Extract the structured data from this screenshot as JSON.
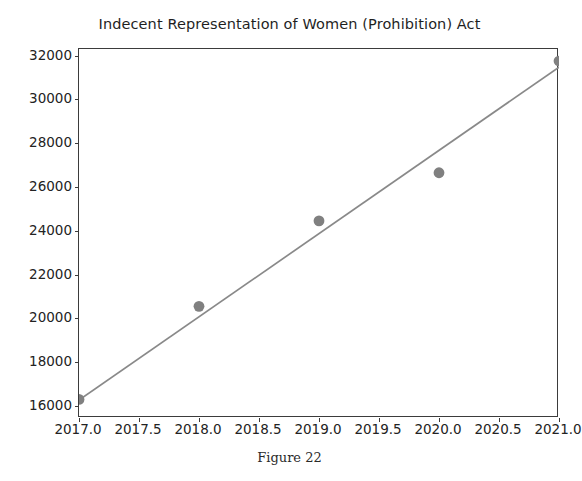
{
  "figure": {
    "caption": "Figure 22",
    "background_color": "#ffffff"
  },
  "chart_data": {
    "type": "scatter",
    "title": "Indecent Representation of Women (Prohibition) Act",
    "xlabel": "",
    "ylabel": "",
    "xlim": [
      2017.0,
      2021.0
    ],
    "ylim": [
      15450,
      32300
    ],
    "grid": false,
    "legend": null,
    "marker_color": "#808080",
    "line_color": "#898989",
    "axis_color": "#3b3b3b",
    "x": [
      2017,
      2018,
      2019,
      2020,
      2021
    ],
    "values": [
      16300,
      20550,
      24450,
      26650,
      31750
    ],
    "series": [
      {
        "name": "Cases",
        "type": "scatter",
        "x": [
          2017,
          2018,
          2019,
          2020,
          2021
        ],
        "values": [
          16300,
          20550,
          24450,
          26650,
          31750
        ]
      },
      {
        "name": "Trend line",
        "type": "line",
        "x": [
          2017,
          2021
        ],
        "values": [
          16270,
          31470
        ]
      }
    ],
    "xticks": [
      2017.0,
      2017.5,
      2018.0,
      2018.5,
      2019.0,
      2019.5,
      2020.0,
      2020.5,
      2021.0
    ],
    "xticklabels": [
      "2017.0",
      "2017.5",
      "2018.0",
      "2018.5",
      "2019.0",
      "2019.5",
      "2020.0",
      "2020.5",
      "2021.0"
    ],
    "yticks": [
      16000,
      18000,
      20000,
      22000,
      24000,
      26000,
      28000,
      30000,
      32000
    ],
    "yticklabels": [
      "16000",
      "18000",
      "20000",
      "22000",
      "24000",
      "26000",
      "28000",
      "30000",
      "32000"
    ]
  }
}
